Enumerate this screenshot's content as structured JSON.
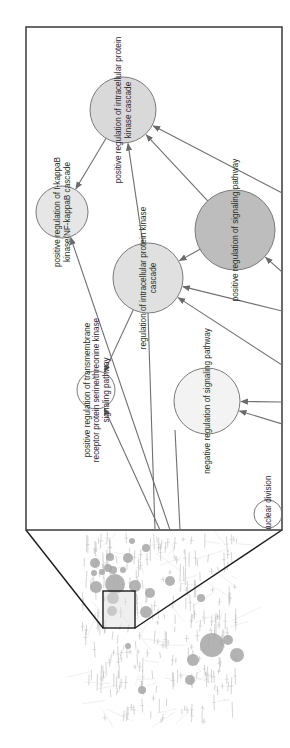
{
  "figure": {
    "type": "network-zoom-inset",
    "orientation": "rotated-90-ccw",
    "colors": {
      "frame": "#333333",
      "edge": "#707070",
      "node_stroke": "#7a7a7a",
      "text": "#2a2a2a"
    }
  },
  "detail_panel": {
    "nodes": [
      {
        "id": "n1",
        "label_lines": [
          "positive regulation of intracellular protein",
          "kinase cascade"
        ],
        "cx": 123,
        "cy": 110,
        "r": 33,
        "fill": "#d9d9d9"
      },
      {
        "id": "n2",
        "label_lines": [
          "positive regulation of I-kappaB",
          "kinase/NF-kappaB cascade"
        ],
        "cx": 62,
        "cy": 212,
        "r": 26,
        "fill": "#e6e6e6"
      },
      {
        "id": "n3",
        "label_lines": [
          "positive regulation of signaling pathway"
        ],
        "cx": 235,
        "cy": 230,
        "r": 40,
        "fill": "#bdbdbd"
      },
      {
        "id": "n4",
        "label_lines": [
          "regulation of intracellular protein kinase",
          "cascade"
        ],
        "cx": 148,
        "cy": 278,
        "r": 35,
        "fill": "#e0e0e0"
      },
      {
        "id": "n5",
        "label_lines": [
          "positive regulation of transmembrane",
          "receptor protein serine/threonine kinase",
          "signaling pathway"
        ],
        "cx": 96,
        "cy": 390,
        "r": 19,
        "fill": "#fafafa"
      },
      {
        "id": "n6",
        "label_lines": [
          "negative regulation of signaling pathway"
        ],
        "cx": 207,
        "cy": 401,
        "r": 33,
        "fill": "#f3f3f3"
      },
      {
        "id": "n7",
        "label_lines": [
          "on of nuclear division"
        ],
        "cx": 268,
        "cy": 514,
        "r": 14,
        "fill": "#ffffff"
      }
    ],
    "edges": [
      {
        "from": "n1",
        "to": "n2"
      },
      {
        "from": "n3",
        "to": "n1"
      },
      {
        "from": "n4",
        "to": "n1"
      },
      {
        "from": "offscreen-right-1",
        "to": "n1"
      },
      {
        "from": "n3",
        "to": "n4"
      },
      {
        "from": "offscreen-right-2",
        "to": "n4"
      },
      {
        "from": "offscreen-right-3",
        "to": "n4"
      },
      {
        "from": "offscreen-bottom-1",
        "to": "n2"
      },
      {
        "from": "n4",
        "to": "n5"
      },
      {
        "from": "offscreen-bottom-2",
        "to": "n5"
      },
      {
        "from": "offscreen-right-4",
        "to": "n6"
      },
      {
        "from": "offscreen-right-5",
        "to": "n6"
      },
      {
        "from": "offscreen-right-6",
        "to": "n3"
      }
    ]
  },
  "overview": {
    "selection_box": {
      "x": 103,
      "y": 591,
      "w": 32,
      "h": 37
    }
  }
}
